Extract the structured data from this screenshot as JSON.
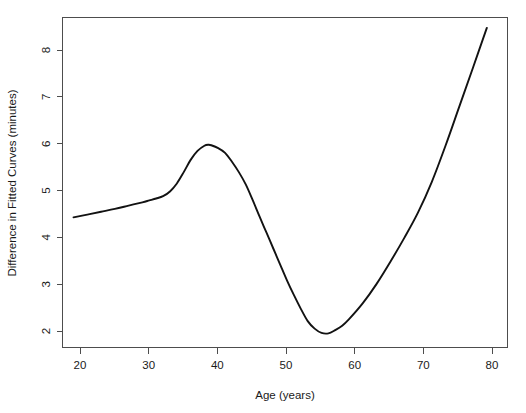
{
  "chart_data": {
    "type": "line",
    "title": "",
    "xlabel": "Age (years)",
    "ylabel": "Difference in Fitted Curves (minutes)",
    "xlim": [
      18.4,
      83.0
    ],
    "ylim": [
      1.72,
      8.72
    ],
    "xticks": [
      20,
      30,
      40,
      50,
      60,
      70,
      80
    ],
    "xtick_labels": [
      "20",
      "30",
      "40",
      "50",
      "60",
      "70",
      "80"
    ],
    "yticks": [
      2,
      3,
      4,
      5,
      6,
      7,
      8
    ],
    "ytick_labels": [
      "2",
      "3",
      "4",
      "5",
      "6",
      "7",
      "8"
    ],
    "grid": false,
    "legend": null,
    "series": [
      {
        "name": "Difference in Fitted Curves",
        "color": "#121212",
        "line_width": 1.9,
        "x": [
          20,
          22,
          24,
          26,
          28,
          30,
          31,
          32,
          33,
          34,
          35,
          36,
          37,
          38,
          39,
          39.6,
          40,
          41,
          42,
          43,
          44,
          45,
          46,
          47,
          48,
          49,
          50,
          51,
          52,
          53,
          54,
          55,
          56,
          57,
          58,
          59,
          60,
          62,
          64,
          66,
          68,
          70,
          72,
          74,
          76,
          78,
          80
        ],
        "y": [
          4.48,
          4.54,
          4.6,
          4.66,
          4.73,
          4.8,
          4.84,
          4.88,
          4.93,
          5.03,
          5.2,
          5.44,
          5.7,
          5.89,
          6.0,
          6.02,
          6.01,
          5.95,
          5.85,
          5.66,
          5.44,
          5.18,
          4.85,
          4.5,
          4.16,
          3.82,
          3.48,
          3.14,
          2.83,
          2.54,
          2.28,
          2.12,
          2.03,
          2.02,
          2.09,
          2.18,
          2.32,
          2.66,
          3.07,
          3.54,
          4.04,
          4.58,
          5.23,
          6.0,
          6.83,
          7.66,
          8.5
        ]
      }
    ],
    "annotations": {
      "peak": {
        "x": 39.6,
        "y": 6.02
      },
      "minimum": {
        "x": 56.4,
        "y": 2.02
      },
      "start": {
        "x": 20,
        "y": 4.48
      },
      "end": {
        "x": 80,
        "y": 8.5
      }
    }
  },
  "figure": {
    "background_color": "#ffffff",
    "axis_color": "#4d4d4d",
    "text_color": "#1a1a1a",
    "curve_color": "#121212"
  }
}
